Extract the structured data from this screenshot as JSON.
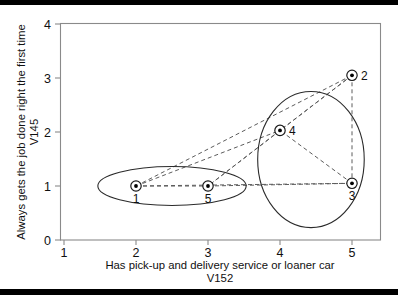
{
  "chart_data": {
    "type": "scatter",
    "title": "",
    "xlabel": "Has pick-up and delivery service or loaner car",
    "xlabel_sub": "V152",
    "ylabel": "Always gets the job done right the first time",
    "ylabel_sub": "V145",
    "xlim": [
      1,
      5.4
    ],
    "ylim": [
      0,
      4
    ],
    "xticks": [
      "1",
      "2",
      "3",
      "4",
      "5"
    ],
    "xtick_values": [
      1,
      2,
      3,
      4,
      5
    ],
    "yticks": [
      "0",
      "1",
      "2",
      "3",
      "4"
    ],
    "ytick_values": [
      0,
      1,
      2,
      3,
      4
    ],
    "grid": false,
    "legend": "none",
    "points": [
      {
        "label": "1",
        "x": 2,
        "y": 1,
        "label_pos": "below"
      },
      {
        "label": "2",
        "x": 5,
        "y": 3.05,
        "label_pos": "right"
      },
      {
        "label": "3",
        "x": 5,
        "y": 1.05,
        "label_pos": "below"
      },
      {
        "label": "4",
        "x": 4,
        "y": 2.03,
        "label_pos": "right"
      },
      {
        "label": "5",
        "x": 3,
        "y": 1,
        "label_pos": "below"
      }
    ],
    "connections": [
      [
        "1",
        "2"
      ],
      [
        "1",
        "3"
      ],
      [
        "1",
        "4"
      ],
      [
        "1",
        "5"
      ],
      [
        "2",
        "3"
      ],
      [
        "2",
        "4"
      ],
      [
        "2",
        "5"
      ],
      [
        "3",
        "4"
      ],
      [
        "3",
        "5"
      ],
      [
        "4",
        "5"
      ]
    ],
    "clusters": [
      {
        "name": "left-cluster",
        "members": [
          "1",
          "5"
        ],
        "cx": 2.5,
        "cy": 1.0,
        "rx": 1.03,
        "ry": 0.36
      },
      {
        "name": "right-cluster",
        "members": [
          "3",
          "4"
        ],
        "cx": 4.43,
        "cy": 1.49,
        "rx": 0.74,
        "ry": 1.26
      }
    ],
    "colors": {
      "frame": "#8a8a8a",
      "ellipse": "#2b2b2b",
      "link": "#5c5c5c",
      "marker": "#000000",
      "text": "#101010",
      "background": "#ffffff"
    },
    "annotations": []
  }
}
